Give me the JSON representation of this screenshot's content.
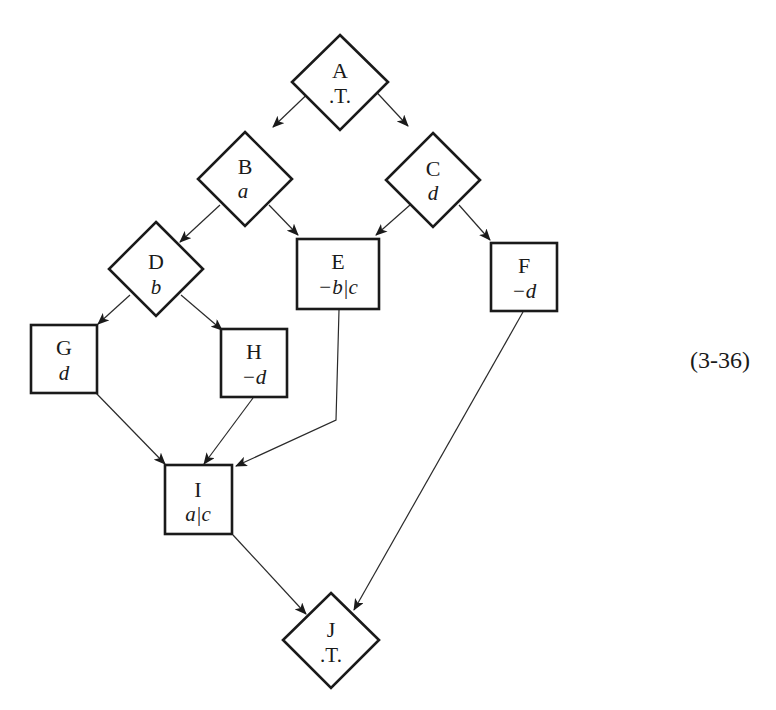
{
  "diagram": {
    "equation_number": "(3-36)",
    "nodes": {
      "A": {
        "name": "A",
        "condition": ".T.",
        "shape": "diamond"
      },
      "B": {
        "name": "B",
        "condition": "a",
        "shape": "diamond"
      },
      "C": {
        "name": "C",
        "condition": "d",
        "shape": "diamond"
      },
      "D": {
        "name": "D",
        "condition": "b",
        "shape": "diamond"
      },
      "E": {
        "name": "E",
        "condition": "−b|c",
        "shape": "box"
      },
      "F": {
        "name": "F",
        "condition": "−d",
        "shape": "box"
      },
      "G": {
        "name": "G",
        "condition": "d",
        "shape": "box"
      },
      "H": {
        "name": "H",
        "condition": "−d",
        "shape": "box"
      },
      "I": {
        "name": "I",
        "condition": "a|c",
        "shape": "box"
      },
      "J": {
        "name": "J",
        "condition": ".T.",
        "shape": "diamond"
      }
    },
    "edges": [
      [
        "A",
        "B"
      ],
      [
        "A",
        "C"
      ],
      [
        "B",
        "D"
      ],
      [
        "B",
        "E"
      ],
      [
        "C",
        "E"
      ],
      [
        "C",
        "F"
      ],
      [
        "D",
        "G"
      ],
      [
        "D",
        "H"
      ],
      [
        "G",
        "I"
      ],
      [
        "H",
        "I"
      ],
      [
        "E",
        "I"
      ],
      [
        "I",
        "J"
      ],
      [
        "F",
        "J"
      ]
    ],
    "colors": {
      "stroke": "#1a1a1a",
      "background": "#ffffff"
    }
  }
}
